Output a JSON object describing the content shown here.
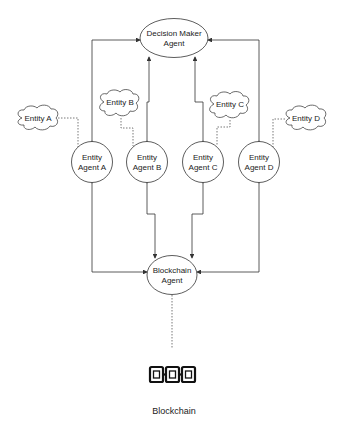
{
  "diagram": {
    "decision_maker": {
      "line1": "Decision Maker",
      "line2": "Agent"
    },
    "entity_agents": [
      {
        "id": "A",
        "line1": "Entity",
        "line2": "Agent A"
      },
      {
        "id": "B",
        "line1": "Entity",
        "line2": "Agent B"
      },
      {
        "id": "C",
        "line1": "Entity",
        "line2": "Agent C"
      },
      {
        "id": "D",
        "line1": "Entity",
        "line2": "Agent D"
      }
    ],
    "entities": [
      {
        "id": "A",
        "label": "Entity A"
      },
      {
        "id": "B",
        "label": "Entity B"
      },
      {
        "id": "C",
        "label": "Entity C"
      },
      {
        "id": "D",
        "label": "Entity D"
      }
    ],
    "blockchain_agent": {
      "line1": "Blockchain",
      "line2": "Agent"
    },
    "blockchain": {
      "icon": "blockchain-chain-icon",
      "label": "Blockchain"
    },
    "colors": {
      "stroke": "#333333",
      "dotted": "#555555",
      "icon": "#111111"
    }
  }
}
